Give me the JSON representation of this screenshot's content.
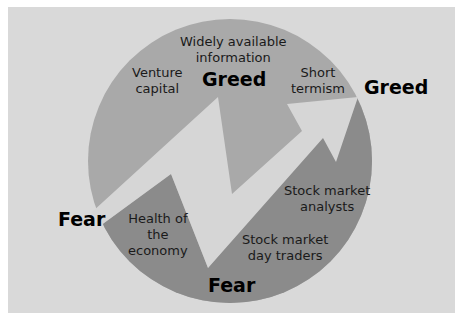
{
  "diagram": {
    "type": "cycle",
    "colors": {
      "background": "#d9d9d9",
      "upper_region": "#a9a9a9",
      "lower_region": "#8b8b8b",
      "arrow": "#d6d6d6",
      "text": "#1a1a1a"
    },
    "state_labels": {
      "greed_top": "Greed",
      "greed_right": "Greed",
      "fear_left": "Fear",
      "fear_bottom": "Fear"
    },
    "greed_factors": {
      "widely_available_information": [
        "Widely available",
        "information"
      ],
      "venture_capital": [
        "Venture",
        "capital"
      ],
      "short_termism": [
        "Short",
        "termism"
      ]
    },
    "fear_factors": {
      "health_of_the_economy": [
        "Health of",
        "the",
        "economy"
      ],
      "stock_market_analysts": [
        "Stock market",
        "analysts"
      ],
      "stock_market_day_traders": [
        "Stock market",
        "day traders"
      ]
    }
  }
}
